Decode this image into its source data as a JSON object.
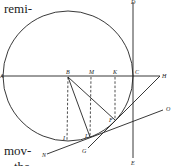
{
  "text_fragments": {
    "top": "remi-",
    "bottom": "mov-",
    "bottom_cut": "the"
  },
  "diagram": {
    "labels": {
      "A": "A",
      "B": "B",
      "M": "M",
      "K": "K",
      "C": "C",
      "H": "H",
      "D": "D",
      "E": "E",
      "F": "F",
      "L": "L",
      "I": "I",
      "G": "G",
      "N": "N",
      "O": "O"
    },
    "circle": {
      "cx": 68,
      "cy": 76,
      "r": 65
    },
    "line_color": "#222222"
  }
}
